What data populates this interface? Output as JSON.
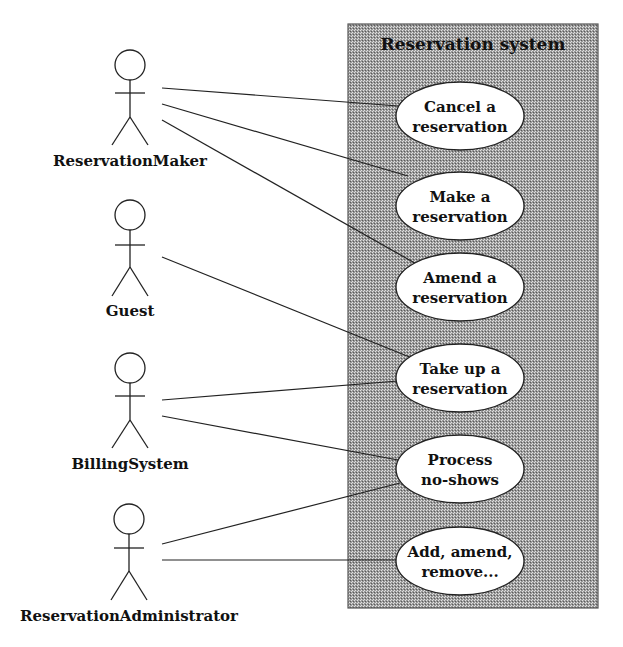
{
  "system": {
    "title": "Reservation system",
    "box": {
      "x": 348,
      "y": 24,
      "w": 250,
      "h": 584
    },
    "fill_dark": "#7a7a7a",
    "fill_light": "#d6d6d6",
    "border": "#555555"
  },
  "actors": [
    {
      "id": "reservation-maker",
      "label": "ReservationMaker",
      "cx": 130,
      "head_cy": 65,
      "label_y": 166
    },
    {
      "id": "guest",
      "label": "Guest",
      "cx": 130,
      "head_cy": 215,
      "label_y": 316
    },
    {
      "id": "billing-system",
      "label": "BillingSystem",
      "cx": 130,
      "head_cy": 368,
      "label_y": 469
    },
    {
      "id": "reservation-administrator",
      "label": "ReservationAdministrator",
      "cx": 129,
      "head_cy": 519,
      "label_y": 621
    }
  ],
  "use_cases": [
    {
      "id": "cancel-reservation",
      "line1": "Cancel a",
      "line2": "reservation",
      "cx": 460,
      "cy": 116
    },
    {
      "id": "make-reservation",
      "line1": "Make a",
      "line2": "reservation",
      "cx": 460,
      "cy": 206
    },
    {
      "id": "amend-reservation",
      "line1": "Amend a",
      "line2": "reservation",
      "cx": 460,
      "cy": 287
    },
    {
      "id": "take-up-reservation",
      "line1": "Take up a",
      "line2": "reservation",
      "cx": 460,
      "cy": 378
    },
    {
      "id": "process-no-shows",
      "line1": "Process",
      "line2": "no-shows",
      "cx": 460,
      "cy": 469
    },
    {
      "id": "add-amend-remove",
      "line1": "Add, amend,",
      "line2": "remove...",
      "cx": 460,
      "cy": 561
    }
  ],
  "associations": [
    {
      "from": "ReservationMaker",
      "to": "Cancel a reservation",
      "x1": 162,
      "y1": 88,
      "x2": 398,
      "y2": 106
    },
    {
      "from": "ReservationMaker",
      "to": "Make a reservation",
      "x1": 162,
      "y1": 104,
      "x2": 408,
      "y2": 176
    },
    {
      "from": "ReservationMaker",
      "to": "Amend a reservation",
      "x1": 162,
      "y1": 120,
      "x2": 420,
      "y2": 266
    },
    {
      "from": "Guest",
      "to": "Take up a reservation",
      "x1": 162,
      "y1": 257,
      "x2": 412,
      "y2": 358
    },
    {
      "from": "BillingSystem",
      "to": "Take up a reservation",
      "x1": 162,
      "y1": 400,
      "x2": 398,
      "y2": 381
    },
    {
      "from": "BillingSystem",
      "to": "Process no-shows",
      "x1": 162,
      "y1": 416,
      "x2": 398,
      "y2": 460
    },
    {
      "from": "ReservationAdministrator",
      "to": "Process no-shows",
      "x1": 162,
      "y1": 544,
      "x2": 400,
      "y2": 483
    },
    {
      "from": "ReservationAdministrator",
      "to": "Add, amend, remove...",
      "x1": 162,
      "y1": 560,
      "x2": 398,
      "y2": 560
    }
  ]
}
